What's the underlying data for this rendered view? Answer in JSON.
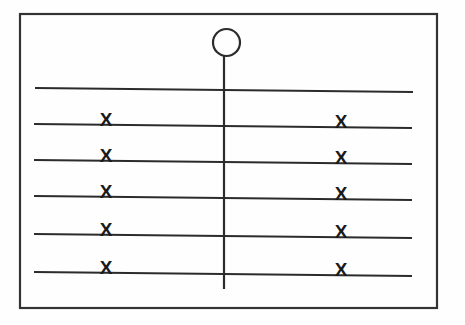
{
  "image": {
    "title": "Hand-drawn ballot-style card diagram",
    "width": 465,
    "height": 325,
    "background_color": "#fefefe",
    "ink_color": "#2b2b2b",
    "mark_color": "#1a1a1a"
  },
  "frame": {
    "name": "outer-border-rectangle",
    "x": 20,
    "y": 14,
    "width": 417,
    "height": 294,
    "stroke_width": 2.2,
    "color": "#333333"
  },
  "pointer": {
    "circle": {
      "name": "circle-head",
      "cx": 226.5,
      "cy": 42.5,
      "r": 13.5,
      "stroke_width": 2.2,
      "color": "#2b2b2b"
    },
    "stem": {
      "name": "vertical-stem-line",
      "x": 224,
      "y1": 56,
      "y2": 289,
      "stroke_width": 2.2,
      "color": "#2b2b2b"
    }
  },
  "rows": [
    {
      "id": "row-1",
      "label": "Top rule (no marks)",
      "x1": 35,
      "y1": 88,
      "x2": 413,
      "y2": 92,
      "stroke_width": 2.0,
      "marks": []
    },
    {
      "id": "row-2",
      "label": "Rule with left and right X",
      "x1": 34,
      "y1": 124,
      "x2": 412,
      "y2": 128,
      "stroke_width": 2.0,
      "marks": [
        {
          "name": "x-mark-left",
          "glyph": "X",
          "x": 106,
          "y": 126
        },
        {
          "name": "x-mark-right",
          "glyph": "X",
          "x": 341,
          "y": 128
        }
      ]
    },
    {
      "id": "row-3",
      "label": "Rule with left and right X",
      "x1": 34,
      "y1": 160,
      "x2": 412,
      "y2": 164,
      "stroke_width": 2.0,
      "marks": [
        {
          "name": "x-mark-left",
          "glyph": "X",
          "x": 106,
          "y": 162
        },
        {
          "name": "x-mark-right",
          "glyph": "X",
          "x": 341,
          "y": 164
        }
      ]
    },
    {
      "id": "row-4",
      "label": "Rule with left and right X",
      "x1": 34,
      "y1": 196,
      "x2": 412,
      "y2": 200,
      "stroke_width": 2.0,
      "marks": [
        {
          "name": "x-mark-left",
          "glyph": "X",
          "x": 106,
          "y": 198
        },
        {
          "name": "x-mark-right",
          "glyph": "X",
          "x": 341,
          "y": 200
        }
      ]
    },
    {
      "id": "row-5",
      "label": "Rule with left and right X",
      "x1": 34,
      "y1": 234,
      "x2": 412,
      "y2": 238,
      "stroke_width": 2.0,
      "marks": [
        {
          "name": "x-mark-left",
          "glyph": "X",
          "x": 106,
          "y": 236
        },
        {
          "name": "x-mark-right",
          "glyph": "X",
          "x": 341,
          "y": 238
        }
      ]
    },
    {
      "id": "row-6",
      "label": "Rule with left and right X",
      "x1": 34,
      "y1": 272,
      "x2": 412,
      "y2": 276,
      "stroke_width": 2.0,
      "marks": [
        {
          "name": "x-mark-left",
          "glyph": "X",
          "x": 106,
          "y": 274
        },
        {
          "name": "x-mark-right",
          "glyph": "X",
          "x": 341,
          "y": 276
        }
      ]
    }
  ],
  "counts": {
    "total_rules": 6,
    "ruled_rows_with_marks": 5,
    "x_marks_total": 10,
    "x_marks_per_row": 2
  }
}
